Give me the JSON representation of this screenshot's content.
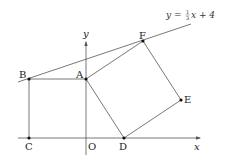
{
  "diagram": {
    "line_equation": {
      "lhs": "y =",
      "frac_num": "1",
      "frac_den": "3",
      "rhs": "x + 4"
    },
    "axes": {
      "x_label": "x",
      "y_label": "y",
      "origin_label": "O"
    },
    "points": {
      "A": "A",
      "B": "B",
      "C": "C",
      "D": "D",
      "E": "E",
      "F": "F"
    },
    "colors": {
      "stroke": "#444444",
      "point": "#111111"
    }
  }
}
